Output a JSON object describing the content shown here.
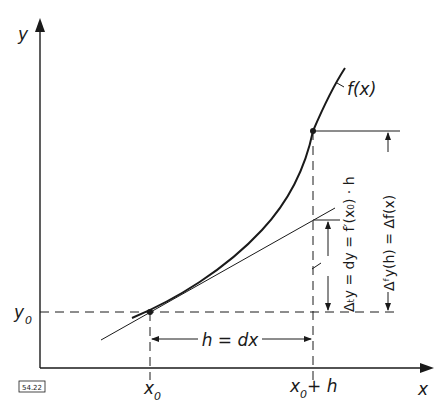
{
  "figure": {
    "id_label": "54.22",
    "axes": {
      "x_label": "x",
      "y_label": "y"
    },
    "function_label": "f(x)",
    "point_labels": {
      "x0": "x",
      "x0_sub": "0",
      "y0": "y",
      "y0_sub": "0",
      "x0_plus_h_x": "x",
      "x0_plus_h_sub": "0",
      "x0_plus_h_rest": " + h"
    },
    "increment_label": "h = dx",
    "differential_label": "Δₜy = dy = f′(x₀) · h",
    "difference_label": "Δᶠy(h) = Δf(x)",
    "colors": {
      "line": "#1a1a1a",
      "background": "#ffffff"
    }
  }
}
